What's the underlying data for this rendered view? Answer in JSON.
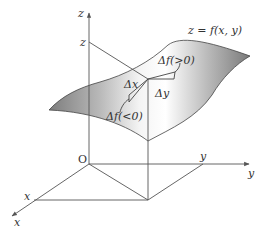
{
  "diagram": {
    "surface_label": "z = f(x, y)",
    "axes": {
      "z_axis_label": "z",
      "y_axis_label": "y",
      "x_axis_label": "x",
      "origin_label": "O"
    },
    "ticks": {
      "z_tick": "z",
      "y_tick": "y",
      "x_tick": "x"
    },
    "annotations": {
      "delta_x": "Δx",
      "delta_y": "Δy",
      "delta_f_positive": "Δf(>0)",
      "delta_f_negative": "Δf(<0)"
    },
    "colors": {
      "line": "#444444",
      "surface_dark": "#8a8a8a",
      "surface_light": "#ffffff",
      "text": "#333333"
    }
  }
}
